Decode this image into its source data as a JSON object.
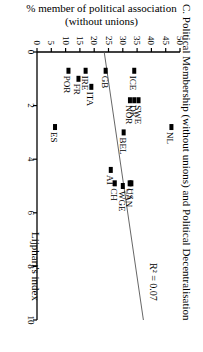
{
  "chart_data": {
    "type": "scatter",
    "title": "C. Political Membership (without unions) and Political Decentralisation",
    "xlabel": "Lijphart's index",
    "ylabel": "% member of political association (without unions)",
    "ylabel_line1": "% member of political association",
    "ylabel_line2": "(without unions)",
    "orientation": "rotated 90° clockwise",
    "xlim": [
      0,
      10
    ],
    "ylim": [
      0,
      50
    ],
    "x_ticks": [
      0,
      2,
      4,
      6,
      8,
      10
    ],
    "y_ticks": [
      0,
      5,
      10,
      15,
      20,
      25,
      30,
      35,
      40,
      45,
      50
    ],
    "grid": false,
    "annotation": "R² = 0.07",
    "points": [
      {
        "label": "ICE",
        "x": 0.7,
        "y": 34
      },
      {
        "label": "GB",
        "x": 0.7,
        "y": 24
      },
      {
        "label": "IRE",
        "x": 0.7,
        "y": 17
      },
      {
        "label": "POR",
        "x": 0.7,
        "y": 11
      },
      {
        "label": "FR",
        "x": 1.0,
        "y": 14.5
      },
      {
        "label": "ITA",
        "x": 1.3,
        "y": 19
      },
      {
        "label": "NOR",
        "x": 1.8,
        "y": 32.5
      },
      {
        "label": "DK",
        "x": 1.8,
        "y": 34
      },
      {
        "label": "SWE",
        "x": 1.8,
        "y": 35.5
      },
      {
        "label": "NL",
        "x": 2.8,
        "y": 47
      },
      {
        "label": "ES",
        "x": 2.8,
        "y": 6.3
      },
      {
        "label": "BEL",
        "x": 3.0,
        "y": 30.3
      },
      {
        "label": "AT",
        "x": 4.4,
        "y": 25.8
      },
      {
        "label": "CH",
        "x": 4.9,
        "y": 27.2
      },
      {
        "label": "US",
        "x": 4.9,
        "y": 33
      },
      {
        "label": "CAN",
        "x": 4.9,
        "y": 32.4
      },
      {
        "label": "WGE",
        "x": 5.0,
        "y": 30
      }
    ],
    "regression_line": {
      "x": [
        0,
        10
      ],
      "y": [
        23.5,
        37.2
      ]
    }
  }
}
